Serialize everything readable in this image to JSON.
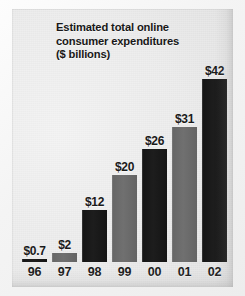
{
  "chart_data": {
    "type": "bar",
    "title": "Estimated total online\nconsumer expenditures\n($ billions)",
    "title_lines": [
      "Estimated total online",
      "consumer expenditures",
      "($ billions)"
    ],
    "xlabel": "",
    "ylabel": "",
    "ylim": [
      0,
      42
    ],
    "grid": false,
    "legend": false,
    "categories": [
      "96",
      "97",
      "98",
      "99",
      "00",
      "01",
      "02"
    ],
    "values": [
      0.7,
      2,
      12,
      20,
      26,
      31,
      42
    ],
    "data_labels": [
      "$0.7",
      "$2",
      "$12",
      "$20",
      "$26",
      "$31",
      "$42"
    ],
    "bar_colors": [
      "#1a1a1a",
      "#6b6b6b",
      "#1a1a1a",
      "#6b6b6b",
      "#1a1a1a",
      "#6b6b6b",
      "#1a1a1a"
    ],
    "series": [
      {
        "name": "Estimated total online consumer expenditures ($ billions)",
        "values": [
          0.7,
          2,
          12,
          20,
          26,
          31,
          42
        ]
      }
    ],
    "points": [
      {
        "category": "96",
        "value": 0.7,
        "label": "$0.7",
        "color": "#1a1a1a"
      },
      {
        "category": "97",
        "value": 2,
        "label": "$2",
        "color": "#6b6b6b"
      },
      {
        "category": "98",
        "value": 12,
        "label": "$12",
        "color": "#1a1a1a"
      },
      {
        "category": "99",
        "value": 20,
        "label": "$20",
        "color": "#6b6b6b"
      },
      {
        "category": "00",
        "value": 26,
        "label": "$26",
        "color": "#1a1a1a"
      },
      {
        "category": "01",
        "value": 31,
        "label": "$31",
        "color": "#6b6b6b"
      },
      {
        "category": "02",
        "value": 42,
        "label": "$42",
        "color": "#1a1a1a"
      }
    ]
  },
  "colors": {
    "panel_background": "#e9e9e9",
    "dark_bar": "#1a1a1a",
    "gray_bar": "#6b6b6b",
    "text": "#181818"
  }
}
